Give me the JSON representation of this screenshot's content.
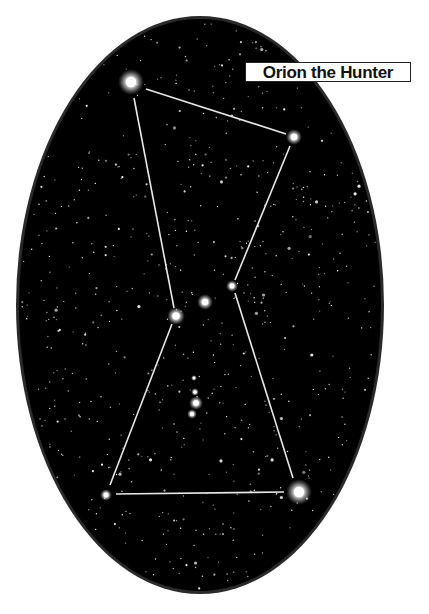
{
  "title": "Orion the Hunter",
  "colors": {
    "background": "#ffffff",
    "sky": "#000000",
    "rim": "#2a2a2a",
    "line": "#e8e8e8",
    "star": "#ffffff"
  },
  "sky_oval": {
    "cx": 200,
    "cy": 305,
    "rx": 184,
    "ry": 289
  },
  "stars": [
    {
      "name": "Betelgeuse",
      "x": 131,
      "y": 82,
      "r": 13
    },
    {
      "name": "Bellatrix",
      "x": 294,
      "y": 137,
      "r": 8
    },
    {
      "name": "Mintaka",
      "x": 232,
      "y": 286,
      "r": 6
    },
    {
      "name": "Alnilam",
      "x": 205,
      "y": 302,
      "r": 8
    },
    {
      "name": "Alnitak",
      "x": 176,
      "y": 316,
      "r": 9
    },
    {
      "name": "Saiph",
      "x": 106,
      "y": 495,
      "r": 6
    },
    {
      "name": "Rigel",
      "x": 299,
      "y": 492,
      "r": 13
    },
    {
      "name": "Sword 1",
      "x": 194,
      "y": 378,
      "r": 3
    },
    {
      "name": "Sword 2",
      "x": 195,
      "y": 392,
      "r": 4
    },
    {
      "name": "Orion Nebula",
      "x": 196,
      "y": 403,
      "r": 7
    },
    {
      "name": "Sword 3",
      "x": 192,
      "y": 414,
      "r": 5
    }
  ],
  "lines": [
    {
      "from": "Betelgeuse",
      "to": "Bellatrix",
      "x1": 146,
      "y1": 89,
      "x2": 286,
      "y2": 134
    },
    {
      "from": "Betelgeuse",
      "to": "Alnitak",
      "x1": 134,
      "y1": 98,
      "x2": 174,
      "y2": 308
    },
    {
      "from": "Bellatrix",
      "to": "Mintaka",
      "x1": 290,
      "y1": 146,
      "x2": 235,
      "y2": 280
    },
    {
      "from": "Alnitak",
      "to": "Saiph",
      "x1": 172,
      "y1": 324,
      "x2": 110,
      "y2": 485
    },
    {
      "from": "Mintaka",
      "to": "Rigel",
      "x1": 235,
      "y1": 293,
      "x2": 293,
      "y2": 478
    },
    {
      "from": "Saiph",
      "to": "Rigel",
      "x1": 116,
      "y1": 494,
      "x2": 284,
      "y2": 492
    }
  ]
}
